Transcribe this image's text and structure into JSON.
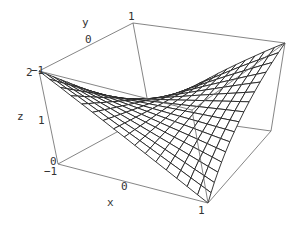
{
  "chart_data": {
    "type": "surface3d",
    "title": "",
    "function": "z = 1 + x*y",
    "xlabel": "x",
    "ylabel": "y",
    "zlabel": "z",
    "x_range": [
      -1,
      1
    ],
    "y_range": [
      -1,
      1
    ],
    "z_range": [
      0,
      2
    ],
    "x_ticks": [
      "-1",
      "0",
      "1"
    ],
    "y_ticks": [
      "-1",
      "0",
      "1"
    ],
    "z_ticks": [
      "0",
      "1",
      "2"
    ],
    "mesh": 16,
    "grid": false,
    "box": true,
    "corner_values": [
      {
        "x": -1,
        "y": -1,
        "z": 2
      },
      {
        "x": 1,
        "y": -1,
        "z": 0
      },
      {
        "x": -1,
        "y": 1,
        "z": 0
      },
      {
        "x": 1,
        "y": 1,
        "z": 2
      }
    ]
  },
  "labels": {
    "x_axis": "x",
    "y_axis": "y",
    "z_axis": "z",
    "x_tick_min": "−1",
    "x_tick_mid": "0",
    "x_tick_max": "1",
    "y_tick_min": "−1",
    "y_tick_mid": "0",
    "y_tick_max": "1",
    "z_tick_min": "0",
    "z_tick_mid": "1",
    "z_tick_max": "2"
  },
  "colors": {
    "box": "#666666",
    "mesh": "#222222",
    "surface_fill": "#ffffff"
  }
}
